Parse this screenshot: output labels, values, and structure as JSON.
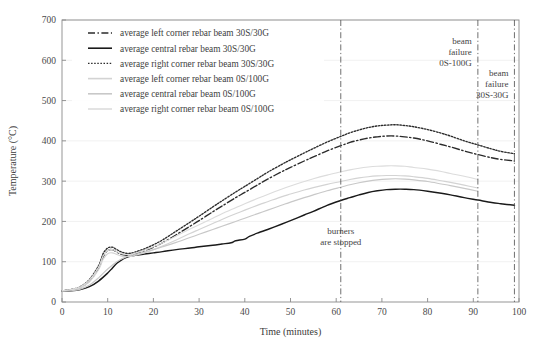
{
  "chart_data": {
    "type": "line",
    "title": "",
    "xlabel": "Time (minutes)",
    "ylabel": "Temperature (°C)",
    "xlim": [
      0,
      100
    ],
    "ylim": [
      0,
      700
    ],
    "xticks": [
      0,
      10,
      20,
      30,
      40,
      50,
      60,
      70,
      80,
      90,
      100
    ],
    "yticks": [
      0,
      100,
      200,
      300,
      400,
      500,
      600,
      700
    ],
    "grid": true,
    "legend_position": "upper-left",
    "series": [
      {
        "name": "average left corner rebar beam 30S/30G",
        "style": "dash-dot",
        "color": "#2b2b2b",
        "x": [
          0,
          2,
          4,
          6,
          8,
          9,
          10,
          11,
          12,
          13,
          14,
          15,
          16,
          18,
          20,
          22,
          25,
          28,
          30,
          33,
          35,
          38,
          40,
          43,
          45,
          48,
          50,
          53,
          55,
          58,
          61,
          63,
          65,
          67,
          69,
          71,
          73,
          75,
          77,
          80,
          83,
          85,
          88,
          91,
          94,
          96,
          99
        ],
        "y": [
          28,
          30,
          36,
          52,
          84,
          112,
          128,
          130,
          124,
          118,
          116,
          116,
          119,
          127,
          136,
          147,
          167,
          188,
          202,
          224,
          238,
          259,
          272,
          292,
          305,
          323,
          334,
          350,
          360,
          375,
          388,
          396,
          402,
          407,
          410,
          412,
          412,
          410,
          407,
          400,
          391,
          385,
          375,
          366,
          358,
          354,
          350
        ]
      },
      {
        "name": "average central rebar beam 30S/30G",
        "style": "solid",
        "color": "#1a1a1a",
        "x": [
          0,
          2,
          4,
          6,
          8,
          10,
          11,
          12,
          13,
          14,
          15,
          16,
          18,
          20,
          22,
          25,
          28,
          30,
          33,
          35,
          37,
          38,
          40,
          41,
          43,
          45,
          48,
          50,
          53,
          55,
          58,
          61,
          63,
          65,
          67,
          69,
          71,
          73,
          75,
          77,
          80,
          83,
          85,
          88,
          91,
          94,
          96,
          99
        ],
        "y": [
          27,
          28,
          31,
          38,
          52,
          72,
          84,
          96,
          104,
          110,
          114,
          116,
          119,
          122,
          125,
          130,
          134,
          137,
          141,
          144,
          147,
          152,
          156,
          163,
          172,
          180,
          193,
          202,
          216,
          225,
          240,
          252,
          259,
          266,
          272,
          276,
          279,
          280,
          280,
          279,
          275,
          270,
          266,
          259,
          253,
          247,
          244,
          240
        ]
      },
      {
        "name": "average right corner rebar beam 30S/30G",
        "style": "dotted",
        "color": "#2b2b2b",
        "x": [
          0,
          2,
          4,
          6,
          8,
          9,
          10,
          11,
          12,
          13,
          14,
          15,
          16,
          18,
          20,
          22,
          25,
          28,
          30,
          33,
          35,
          38,
          40,
          43,
          45,
          48,
          50,
          53,
          55,
          58,
          61,
          63,
          65,
          67,
          69,
          71,
          73,
          75,
          77,
          80,
          83,
          85,
          88,
          91,
          94,
          96,
          99
        ],
        "y": [
          28,
          31,
          38,
          56,
          90,
          120,
          134,
          136,
          130,
          124,
          121,
          121,
          124,
          132,
          142,
          154,
          176,
          198,
          213,
          236,
          251,
          273,
          287,
          308,
          322,
          341,
          353,
          370,
          381,
          397,
          411,
          420,
          427,
          433,
          437,
          439,
          440,
          438,
          435,
          428,
          419,
          412,
          400,
          390,
          380,
          374,
          368
        ]
      },
      {
        "name": "average left corner rebar beam 0S/100G",
        "style": "solid",
        "color": "#d3d3d3",
        "x": [
          0,
          2,
          4,
          6,
          8,
          9,
          10,
          11,
          12,
          13,
          14,
          15,
          16,
          18,
          20,
          22,
          25,
          28,
          30,
          33,
          35,
          38,
          40,
          43,
          45,
          48,
          50,
          53,
          55,
          58,
          61,
          63,
          65,
          67,
          69,
          71,
          73,
          75,
          77,
          80,
          83,
          85,
          88,
          91
        ],
        "y": [
          28,
          30,
          35,
          50,
          80,
          106,
          120,
          122,
          118,
          114,
          113,
          113,
          116,
          122,
          130,
          139,
          154,
          170,
          180,
          195,
          205,
          219,
          228,
          241,
          249,
          261,
          268,
          278,
          284,
          292,
          299,
          304,
          308,
          311,
          313,
          314,
          314,
          313,
          311,
          307,
          301,
          297,
          290,
          283
        ]
      },
      {
        "name": "average central rebar beam 0S/100G",
        "style": "solid",
        "color": "#c8c8c8",
        "x": [
          0,
          2,
          4,
          6,
          8,
          10,
          12,
          14,
          16,
          18,
          20,
          22,
          25,
          28,
          30,
          33,
          35,
          38,
          40,
          43,
          45,
          48,
          50,
          53,
          55,
          58,
          61,
          63,
          65,
          67,
          69,
          71,
          73,
          75,
          77,
          80,
          83,
          85,
          88,
          91
        ],
        "y": [
          27,
          28,
          32,
          42,
          60,
          82,
          100,
          112,
          118,
          124,
          130,
          137,
          148,
          160,
          168,
          180,
          188,
          200,
          208,
          220,
          228,
          240,
          248,
          259,
          266,
          276,
          285,
          291,
          296,
          300,
          303,
          305,
          306,
          305,
          303,
          299,
          293,
          289,
          282,
          275
        ]
      },
      {
        "name": "average right corner rebar beam 0S/100G",
        "style": "solid",
        "color": "#dcdcdc",
        "x": [
          0,
          2,
          4,
          6,
          8,
          9,
          10,
          11,
          12,
          13,
          14,
          15,
          16,
          18,
          20,
          22,
          25,
          28,
          30,
          33,
          35,
          38,
          40,
          43,
          45,
          48,
          50,
          53,
          55,
          58,
          61,
          63,
          65,
          67,
          69,
          71,
          73,
          75,
          77,
          80,
          83,
          85,
          88,
          91
        ],
        "y": [
          28,
          31,
          37,
          54,
          86,
          114,
          128,
          130,
          125,
          120,
          118,
          118,
          121,
          128,
          137,
          147,
          164,
          181,
          192,
          208,
          219,
          234,
          244,
          258,
          267,
          280,
          288,
          299,
          306,
          315,
          323,
          328,
          332,
          335,
          337,
          338,
          338,
          337,
          334,
          330,
          324,
          319,
          312,
          304
        ]
      }
    ],
    "annotations": [
      {
        "id": "burners-stopped",
        "text_lines": [
          "burners",
          "are stopped"
        ],
        "x": 61,
        "y": 170,
        "vline": true
      },
      {
        "id": "beam-failure-0s-100g",
        "text_lines": [
          "beam",
          "failure",
          "0S-100G"
        ],
        "x": 91,
        "y": 640,
        "vline": true
      },
      {
        "id": "beam-failure-30s-30g",
        "text_lines": [
          "beam",
          "failure",
          "30S-30G"
        ],
        "x": 99,
        "y": 560,
        "vline": true
      }
    ]
  },
  "legend": {
    "items": [
      {
        "label": "average left corner rebar beam 30S/30G",
        "style": "dash-dot",
        "color": "#2b2b2b"
      },
      {
        "label": "average central rebar beam 30S/30G",
        "style": "solid",
        "color": "#1a1a1a"
      },
      {
        "label": "average right corner rebar beam 30S/30G",
        "style": "dotted",
        "color": "#2b2b2b"
      },
      {
        "label": "average left corner rebar beam 0S/100G",
        "style": "solid",
        "color": "#d3d3d3"
      },
      {
        "label": "average central rebar beam 0S/100G",
        "style": "solid",
        "color": "#c8c8c8"
      },
      {
        "label": "average right corner rebar beam 0S/100G",
        "style": "solid",
        "color": "#dcdcdc"
      }
    ]
  },
  "axes": {
    "x_title": "Time (minutes)",
    "y_title": "Temperature (°C)"
  },
  "colors": {
    "axis": "#8a8a8a",
    "grid": "#ededed",
    "text": "#3a3a3a",
    "vline": "#555555",
    "background": "#ffffff"
  }
}
